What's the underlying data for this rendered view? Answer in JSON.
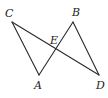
{
  "diagram": {
    "type": "geometry",
    "points": {
      "C": {
        "x": 12,
        "y": 22,
        "label": "C",
        "lx": 5,
        "ly": 17
      },
      "B": {
        "x": 73,
        "y": 22,
        "label": "B",
        "lx": 72,
        "ly": 16
      },
      "A": {
        "x": 39,
        "y": 75,
        "label": "A",
        "lx": 34,
        "ly": 89
      },
      "D": {
        "x": 99,
        "y": 75,
        "label": "D",
        "lx": 96,
        "ly": 89
      },
      "E": {
        "x": 57,
        "y": 50,
        "label": "E",
        "lx": 50,
        "ly": 44
      }
    },
    "segments": [
      {
        "from": "C",
        "to": "A"
      },
      {
        "from": "C",
        "to": "D"
      },
      {
        "from": "A",
        "to": "B"
      },
      {
        "from": "B",
        "to": "D"
      }
    ]
  }
}
